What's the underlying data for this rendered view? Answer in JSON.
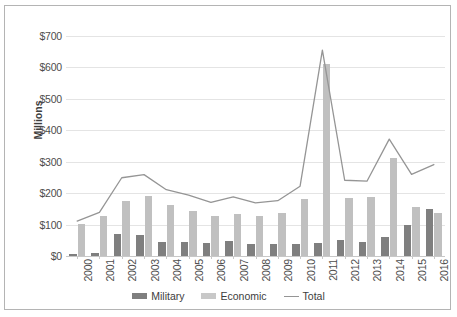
{
  "chart_data": {
    "type": "bar",
    "title": "",
    "subtitle": "",
    "xlabel": "",
    "ylabel": "Millions",
    "ylim": [
      0,
      700
    ],
    "ytick_step": 100,
    "ytick_labels": [
      "$0",
      "$100",
      "$200",
      "$300",
      "$400",
      "$500",
      "$600",
      "$700"
    ],
    "ytick_values": [
      0,
      100,
      200,
      300,
      400,
      500,
      600,
      700
    ],
    "grid": true,
    "legend_position": "bottom",
    "categories": [
      "2000",
      "2001",
      "2002",
      "2003",
      "2004",
      "2005",
      "2006",
      "2007",
      "2008",
      "2009",
      "2010",
      "2011",
      "2012",
      "2013",
      "2014",
      "2015",
      "2016"
    ],
    "series": [
      {
        "name": "Military",
        "type": "bar",
        "color": "#7f7f7f",
        "values": [
          5,
          10,
          71,
          66,
          45,
          45,
          41,
          48,
          37,
          38,
          37,
          41,
          52,
          46,
          61,
          100,
          151
        ]
      },
      {
        "name": "Economic",
        "type": "bar",
        "color": "#c0c0c0",
        "values": [
          102,
          127,
          175,
          190,
          161,
          143,
          126,
          134,
          128,
          136,
          181,
          612,
          186,
          188,
          311,
          155,
          136
        ]
      },
      {
        "name": "Total",
        "type": "line",
        "color": "#959595",
        "values": [
          111,
          139,
          249,
          259,
          211,
          194,
          171,
          188,
          169,
          176,
          222,
          655,
          241,
          238,
          372,
          260,
          291
        ]
      }
    ]
  },
  "legend": {
    "items": [
      {
        "label": "Military",
        "marker": "bar-swatch-dark"
      },
      {
        "label": "Economic",
        "marker": "bar-swatch-light"
      },
      {
        "label": "Total",
        "marker": "line-swatch"
      }
    ]
  },
  "colors": {
    "military": "#7f7f7f",
    "economic": "#c0c0c0",
    "total_line": "#959595",
    "gridline": "#e4e4e4",
    "border": "#b4b4b4",
    "text": "#4d4d4d",
    "background": "#ffffff"
  }
}
